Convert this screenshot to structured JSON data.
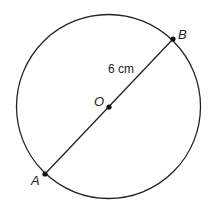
{
  "diagram": {
    "circle": {
      "cx": 108.5,
      "cy": 106.5,
      "r": 92,
      "stroke": "#222222"
    },
    "diameter": {
      "from": "A",
      "to": "B",
      "length_label": "6 cm"
    },
    "points": {
      "A": {
        "label": "A",
        "x": 45,
        "y": 174
      },
      "B": {
        "label": "B",
        "x": 173,
        "y": 39
      },
      "O": {
        "label": "O",
        "x": 109,
        "y": 107
      }
    }
  }
}
